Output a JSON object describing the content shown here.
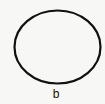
{
  "figure": {
    "label": "b",
    "shape": "ellipse",
    "stroke_color": "#111111",
    "background_color": "#f7f7f5"
  }
}
